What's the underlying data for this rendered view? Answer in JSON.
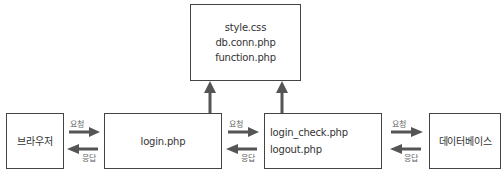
{
  "diagram": {
    "top_box": {
      "lines": [
        "style.css",
        "db.conn.php",
        "function.php"
      ]
    },
    "browser_box": {
      "label": "브라우저"
    },
    "login_box": {
      "label": "login.php"
    },
    "check_box": {
      "lines": [
        "login_check.php",
        "logout.php"
      ]
    },
    "db_box": {
      "label": "데이터베이스"
    },
    "arrows": {
      "request_label": "요청",
      "response_label": "응답"
    },
    "colors": {
      "arrow": "#555555",
      "border": "#444444",
      "text": "#333333"
    }
  }
}
